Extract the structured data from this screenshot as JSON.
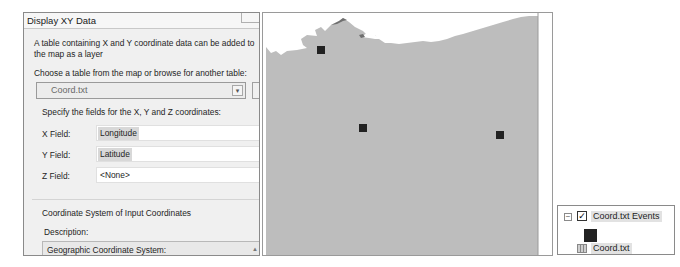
{
  "dialog": {
    "title": "Display XY Data",
    "intro": "A table containing X and Y coordinate data can be added to the map as a layer",
    "choose_label": "Choose a table from the map or browse for another table:",
    "table_value": "Coord.txt",
    "specify_label": "Specify the fields for the X, Y and Z coordinates:",
    "fields": [
      {
        "label": "X Field:",
        "value": "Longitude"
      },
      {
        "label": "Y Field:",
        "value": "Latitude"
      },
      {
        "label": "Z Field:",
        "value": "<None>"
      }
    ],
    "coord_system_title": "Coordinate System of Input Coordinates",
    "description_label": "Description:",
    "description_line1": "Geographic Coordinate System:",
    "description_line2": "Name: GCS_North_American_1983"
  },
  "map": {
    "land_color": "#bdbdbd",
    "water_color": "#ffffff",
    "point_color": "#222222",
    "points": [
      {
        "x": 58,
        "y": 37
      },
      {
        "x": 100,
        "y": 115
      },
      {
        "x": 237,
        "y": 122
      }
    ]
  },
  "legend": {
    "layer_name": "Coord.txt Events",
    "layer_checked": true,
    "collapse_symbol": "−",
    "check_symbol": "✓",
    "table_name": "Coord.txt"
  }
}
